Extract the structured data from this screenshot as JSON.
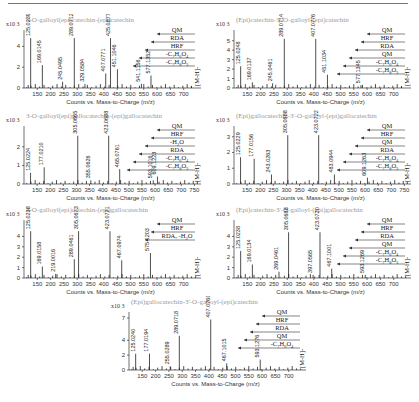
{
  "chart_data": [
    {
      "type": "bar",
      "id": "p1",
      "title": "3-O-galloyl(epi)catechin-(epi)catechin",
      "scale": "x10 3",
      "xlabel": "Counts vs. Mass-to-Charge (m/z)",
      "ylabel": "",
      "xlim": [
        100,
        750
      ],
      "ylim": [
        0,
        5
      ],
      "yticks": [
        0,
        2,
        4
      ],
      "xticks": [
        150,
        200,
        250,
        300,
        350,
        400,
        450,
        500,
        550,
        600,
        650,
        700
      ],
      "peaks": [
        {
          "mz": 125.0239,
          "y": 4.8,
          "label": "125.0239"
        },
        {
          "mz": 169.0145,
          "y": 2.2,
          "label": "169.0145"
        },
        {
          "mz": 245.0495,
          "y": 0.6,
          "label": "245.0495"
        },
        {
          "mz": 289.0712,
          "y": 4.8,
          "label": "289.0712"
        },
        {
          "mz": 329.0584,
          "y": 0.4,
          "label": "329.0584"
        },
        {
          "mz": 407.0771,
          "y": 1.4,
          "label": "407.0771"
        },
        {
          "mz": 425.0877,
          "y": 4.8,
          "label": "425.0877"
        },
        {
          "mz": 451.1046,
          "y": 1.8,
          "label": "451.1046"
        },
        {
          "mz": 541.1156,
          "y": 0.4,
          "label": "541.1156"
        },
        {
          "mz": 577.1352,
          "y": 1.2,
          "label": "577.1352"
        },
        {
          "mz": 729.1,
          "y": 0.2,
          "label": ""
        }
      ],
      "annotations": [
        "QM",
        "RDA",
        "HRF",
        "-C7H6O4",
        "-C7H8O3",
        "[M-H]-"
      ]
    },
    {
      "type": "bar",
      "id": "p2",
      "title": "(Epi)catechin-3'-O-galloyl-(epi)catechin",
      "scale": "x10 3",
      "xlabel": "Counts vs. Mass-to-Charge (m/z)",
      "xlim": [
        100,
        750
      ],
      "ylim": [
        0,
        5.5
      ],
      "yticks": [
        0,
        1,
        2,
        3,
        4,
        5
      ],
      "xticks": [
        150,
        200,
        250,
        300,
        350,
        400,
        450,
        500,
        550,
        600,
        650,
        700
      ],
      "peaks": [
        {
          "mz": 125.0248,
          "y": 2.3,
          "label": "125.0248"
        },
        {
          "mz": 169.0137,
          "y": 0.6,
          "label": "169.0137"
        },
        {
          "mz": 245.0461,
          "y": 0.5,
          "label": "245.0461"
        },
        {
          "mz": 289.0714,
          "y": 5.2,
          "label": "289.0714"
        },
        {
          "mz": 407.0776,
          "y": 5.2,
          "label": "407.0776"
        },
        {
          "mz": 451.1034,
          "y": 1.4,
          "label": "451.1034"
        },
        {
          "mz": 577.1345,
          "y": 0.3,
          "label": "577.1345"
        },
        {
          "mz": 729.1,
          "y": 0.2,
          "label": ""
        }
      ],
      "annotations": [
        "QM",
        "HRF",
        "RDA",
        "QM",
        "-C7H6O4",
        "-C7H8O3",
        "[M-H]-"
      ]
    },
    {
      "type": "bar",
      "id": "p3",
      "title": "3-O-galloyl(epi)gallocatechin-(epi)gallocatechin",
      "scale": "x10 3",
      "xlabel": "Counts vs. Mass-to-Charge (m/z)",
      "xlim": [
        100,
        760
      ],
      "ylim": [
        0,
        2.8
      ],
      "yticks": [
        0,
        1,
        2
      ],
      "xticks": [
        150,
        200,
        250,
        300,
        350,
        400,
        450,
        500,
        550,
        600,
        650,
        700,
        750
      ],
      "peaks": [
        {
          "mz": 125.0224,
          "y": 0.6,
          "label": "125.0224"
        },
        {
          "mz": 177.021,
          "y": 0.9,
          "label": "177.0210"
        },
        {
          "mz": 305.0665,
          "y": 2.6,
          "label": "305.0665"
        },
        {
          "mz": 355.0626,
          "y": 0.2,
          "label": "355.0626"
        },
        {
          "mz": 423.0688,
          "y": 2.6,
          "label": "423.0688"
        },
        {
          "mz": 465.0761,
          "y": 0.8,
          "label": "465.0761"
        },
        {
          "mz": 593.1016,
          "y": 0.2,
          "label": "593.1016"
        },
        {
          "mz": 609.1223,
          "y": 0.4,
          "label": "609.1223"
        },
        {
          "mz": 761.1,
          "y": 0.15,
          "label": ""
        }
      ],
      "annotations": [
        "QM",
        "HRF",
        "-H2O",
        "RDA",
        "-C7H6O4",
        "-C7H8O3",
        "[M-H]-"
      ]
    },
    {
      "type": "bar",
      "id": "p4",
      "title": "(Epi)gallocatechin-3'-O-galloyl-(epi)gallocatechin",
      "scale": "x10 3",
      "xlabel": "Counts vs. Mass-to-Charge (m/z)",
      "xlim": [
        100,
        760
      ],
      "ylim": [
        0,
        3.3
      ],
      "yticks": [
        0,
        1,
        2,
        3
      ],
      "xticks": [
        150,
        200,
        250,
        300,
        350,
        400,
        450,
        500,
        550,
        600,
        650,
        700,
        750
      ],
      "peaks": [
        {
          "mz": 125.0229,
          "y": 1.7,
          "label": "125.0229"
        },
        {
          "mz": 177.0156,
          "y": 1.6,
          "label": "177.0156"
        },
        {
          "mz": 243.0263,
          "y": 0.6,
          "label": "243.0263"
        },
        {
          "mz": 305.0688,
          "y": 3.1,
          "label": "305.0688"
        },
        {
          "mz": 423.0722,
          "y": 3.1,
          "label": "423.0722"
        },
        {
          "mz": 483.0944,
          "y": 0.6,
          "label": "483.0944"
        },
        {
          "mz": 609.1263,
          "y": 0.4,
          "label": "609.1263"
        },
        {
          "mz": 761.1,
          "y": 0.15,
          "label": ""
        }
      ],
      "annotations": [
        "QM",
        "HRF",
        "QM",
        "RDA",
        "-C7H6O4",
        "-C7H8O3",
        "[M-H]-"
      ]
    },
    {
      "type": "bar",
      "id": "p5",
      "title": "3-O-galloyl(epi)catechin-(epi)gallocatechin",
      "scale": "x10 3",
      "xlabel": "Counts vs. Mass-to-Charge (m/z)",
      "xlim": [
        100,
        750
      ],
      "ylim": [
        0,
        5
      ],
      "yticks": [
        0,
        1,
        2,
        3,
        4
      ],
      "xticks": [
        150,
        200,
        250,
        300,
        350,
        400,
        450,
        500,
        550,
        600,
        650,
        700
      ],
      "peaks": [
        {
          "mz": 125.0238,
          "y": 4.5,
          "label": "125.0238"
        },
        {
          "mz": 169.0158,
          "y": 1.1,
          "label": "169.0158"
        },
        {
          "mz": 219.0016,
          "y": 0.4,
          "label": "219.0016"
        },
        {
          "mz": 289.0461,
          "y": 1.8,
          "label": "289.0461"
        },
        {
          "mz": 305.0673,
          "y": 4.5,
          "label": "305.0673"
        },
        {
          "mz": 423.0721,
          "y": 4.5,
          "label": "423.0721"
        },
        {
          "mz": 467.0974,
          "y": 1.7,
          "label": "467.0974"
        },
        {
          "mz": 575.1203,
          "y": 2.4,
          "label": "575.1203"
        },
        {
          "mz": 745.1,
          "y": 0.2,
          "label": ""
        }
      ],
      "annotations": [
        "QM",
        "HRF",
        "RDA, -H2O",
        "[M-H]-"
      ]
    },
    {
      "type": "bar",
      "id": "p6",
      "title": "(Epi)catechin-3'-O-galloyl-(epi)gallocatechin",
      "scale": "x10 3",
      "xlabel": "Counts vs. Mass-to-Charge (m/z)",
      "xlim": [
        100,
        750
      ],
      "ylim": [
        0,
        5
      ],
      "yticks": [
        0,
        1,
        2,
        3,
        4
      ],
      "xticks": [
        150,
        200,
        250,
        300,
        350,
        400,
        450,
        500,
        550,
        600,
        650,
        700
      ],
      "peaks": [
        {
          "mz": 125.0238,
          "y": 2.6,
          "label": "125.0238"
        },
        {
          "mz": 169.0134,
          "y": 1.3,
          "label": "169.0134"
        },
        {
          "mz": 269.0461,
          "y": 0.6,
          "label": "269.0461"
        },
        {
          "mz": 305.0688,
          "y": 4.4,
          "label": "305.0688"
        },
        {
          "mz": 397.0565,
          "y": 0.3,
          "label": "397.0565"
        },
        {
          "mz": 423.072,
          "y": 4.4,
          "label": "423.0720"
        },
        {
          "mz": 467.1001,
          "y": 0.9,
          "label": "467.1001"
        },
        {
          "mz": 593.1269,
          "y": 0.3,
          "label": "593.1269"
        },
        {
          "mz": 745.1,
          "y": 0.2,
          "label": ""
        }
      ],
      "annotations": [
        "QM",
        "HRF",
        "RDA",
        "QM",
        "-C7H6O4",
        "-C7H8O3",
        "[M-H]-"
      ]
    },
    {
      "type": "bar",
      "id": "p7",
      "title": "(Epi)gallocatechin-3'-O-galloyl-(epi)catechin",
      "scale": "x10 3",
      "xlabel": "Counts vs. Mass-to-Charge (m/z)",
      "xlim": [
        100,
        750
      ],
      "ylim": [
        0,
        7
      ],
      "yticks": [
        0,
        2,
        4,
        7
      ],
      "xticks": [
        150,
        200,
        250,
        300,
        350,
        400,
        450,
        500,
        550,
        600,
        650,
        700
      ],
      "peaks": [
        {
          "mz": 125.024,
          "y": 2.2,
          "label": "125.0240"
        },
        {
          "mz": 177.0194,
          "y": 2.2,
          "label": "177.0194"
        },
        {
          "mz": 255.0289,
          "y": 0.5,
          "label": "255.0289"
        },
        {
          "mz": 289.0718,
          "y": 4.6,
          "label": "289.0718"
        },
        {
          "mz": 407.076,
          "y": 6.8,
          "label": "407.0760"
        },
        {
          "mz": 467.1015,
          "y": 0.9,
          "label": "467.1015"
        },
        {
          "mz": 593.1276,
          "y": 1.4,
          "label": "593.1276"
        },
        {
          "mz": 745.1,
          "y": 0.2,
          "label": ""
        }
      ],
      "annotations": [
        "QM",
        "HRF",
        "RDA",
        "QM",
        "-C7H6O4",
        "[M-H]-"
      ]
    }
  ]
}
